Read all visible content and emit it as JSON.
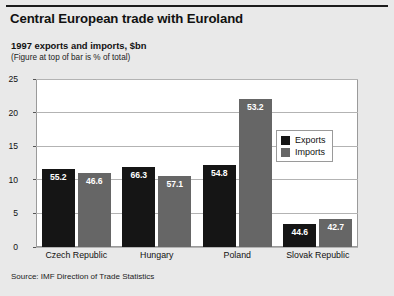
{
  "figure": {
    "title": "Central European trade with Euroland",
    "subtitle": "1997 exports and imports, $bn",
    "note": "(Figure at top of bar is % of total)",
    "source": "Source: IMF Direction of Trade Statistics",
    "colors": {
      "background": "#e9e9e9",
      "plot_background": "#ffffff",
      "exports": "#151515",
      "imports": "#666666",
      "gridline": "#b3b3b3",
      "frame": "#9a9a9a"
    }
  },
  "chart_data": {
    "type": "bar",
    "title": "Central European trade with Euroland",
    "subtitle": "1997 exports and imports, $bn",
    "annotation": "(Figure at top of bar is % of total)",
    "xlabel": "",
    "ylabel": "",
    "ylim": [
      0,
      25
    ],
    "yticks": [
      0,
      5,
      10,
      15,
      20,
      25
    ],
    "ytick_labels": [
      "0",
      "5",
      "10",
      "15",
      "20",
      "25"
    ],
    "grid": true,
    "legend_position": "right-inside",
    "categories": [
      "Czech Republic",
      "Hungary",
      "Poland",
      "Slovak Republic"
    ],
    "series": [
      {
        "name": "Exports",
        "color": "#151515",
        "values": [
          11.6,
          11.9,
          12.2,
          3.4
        ],
        "labels": [
          "55.2",
          "66.3",
          "54.8",
          "44.6"
        ]
      },
      {
        "name": "Imports",
        "color": "#666666",
        "values": [
          11.0,
          10.6,
          22.0,
          4.1
        ],
        "labels": [
          "46.6",
          "57.1",
          "53.2",
          "42.7"
        ]
      }
    ],
    "bar_labels_are": "% of total",
    "source": "Source: IMF Direction of Trade Statistics"
  }
}
